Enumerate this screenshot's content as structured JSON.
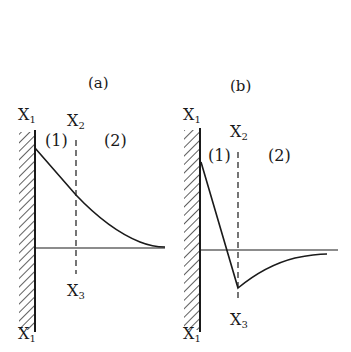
{
  "figure": {
    "panels": [
      {
        "id": "a",
        "title": "(a)",
        "wall_top_label": {
          "base": "X",
          "sub": "1"
        },
        "wall_bottom_label": {
          "base": "X",
          "sub": "1"
        },
        "boundary_top_label": {
          "base": "X",
          "sub": "2"
        },
        "boundary_bottom_label": {
          "base": "X",
          "sub": "3"
        },
        "region_1": "(1)",
        "region_2": "(2)",
        "curve_description": "Linear decrease in region (1) from wall to X2-X3 line, then exponential-like decay to baseline in region (2); stays positive"
      },
      {
        "id": "b",
        "title": "(b)",
        "wall_top_label": {
          "base": "X",
          "sub": "1"
        },
        "wall_bottom_label": {
          "base": "X",
          "sub": "1"
        },
        "boundary_top_label": {
          "base": "X",
          "sub": "2"
        },
        "boundary_bottom_label": {
          "base": "X",
          "sub": "3"
        },
        "region_1": "(1)",
        "region_2": "(2)",
        "curve_description": "Steep linear decrease crossing baseline in region (1), minimum (negative) at X2-X3 line, then recovers asymptotically toward baseline in region (2)"
      }
    ],
    "colors": {
      "line": "#1a1a1a",
      "background": "#ffffff"
    }
  }
}
